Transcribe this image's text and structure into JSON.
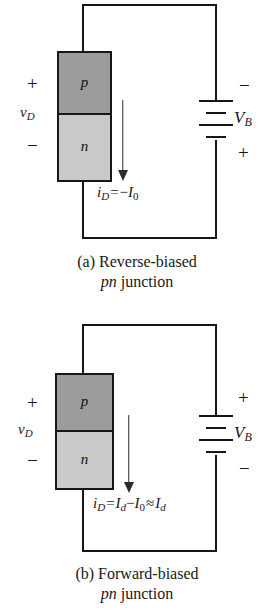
{
  "figure": {
    "panels": [
      {
        "id": "a",
        "caption_line1": "(a) Reverse-biased",
        "caption_line2_italic": "pn",
        "caption_line2_rest": " junction",
        "semiconductor": {
          "p_label": "p",
          "n_label": "n",
          "p_color": "#9c9c9c",
          "n_color": "#c9c9c9"
        },
        "diode_terminals": {
          "top_sign": "+",
          "voltage_label": "v",
          "voltage_sub": "D",
          "bottom_sign": "−"
        },
        "battery": {
          "top_sign": "−",
          "label": "V",
          "label_sub": "B",
          "bottom_sign": "+"
        },
        "current": {
          "arrow_direction": "down",
          "equation_lhs": "i",
          "equation_lhs_sub": "D",
          "equation_op1": "=",
          "equation_rhs_sign": "−",
          "equation_rhs": "I",
          "equation_rhs_sub": "0"
        }
      },
      {
        "id": "b",
        "caption_line1": "(b) Forward-biased",
        "caption_line2_italic": "pn",
        "caption_line2_rest": " junction",
        "semiconductor": {
          "p_label": "p",
          "n_label": "n",
          "p_color": "#9c9c9c",
          "n_color": "#c9c9c9"
        },
        "diode_terminals": {
          "top_sign": "+",
          "voltage_label": "v",
          "voltage_sub": "D",
          "bottom_sign": "−"
        },
        "battery": {
          "top_sign": "+",
          "label": "V",
          "label_sub": "B",
          "bottom_sign": "−"
        },
        "current": {
          "arrow_direction": "down",
          "equation_lhs": "i",
          "equation_lhs_sub": "D",
          "equation_op1": "=",
          "equation_term1": "I",
          "equation_term1_sub": "d",
          "equation_op2": "−",
          "equation_term2": "I",
          "equation_term2_sub": "0",
          "equation_op3": "≈",
          "equation_term3": "I",
          "equation_term3_sub": "d"
        }
      }
    ]
  },
  "colors": {
    "ink": "#17171a",
    "p_region": "#9c9c9c",
    "n_region": "#c9c9c9",
    "page": "#ffffff"
  }
}
